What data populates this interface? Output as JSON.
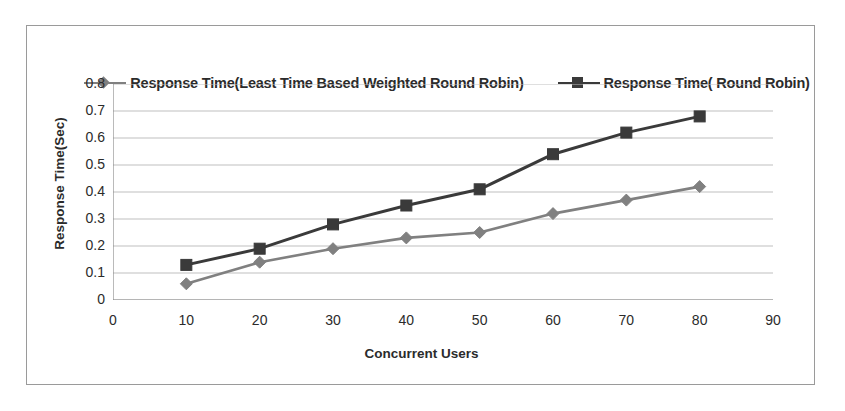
{
  "chart_data": {
    "type": "line",
    "title": "",
    "xlabel": "Concurrent Users",
    "ylabel": "Response Time(Sec)",
    "x": [
      10,
      20,
      30,
      40,
      50,
      60,
      70,
      80
    ],
    "xlim": [
      0,
      90
    ],
    "ylim": [
      0,
      0.8
    ],
    "xticks": [
      "0",
      "10",
      "20",
      "30",
      "40",
      "50",
      "60",
      "70",
      "80",
      "90"
    ],
    "xtick_values": [
      0,
      10,
      20,
      30,
      40,
      50,
      60,
      70,
      80,
      90
    ],
    "yticks": [
      "0",
      "0.1",
      "0.2",
      "0.3",
      "0.4",
      "0.5",
      "0.6",
      "0.7",
      "0.8"
    ],
    "ytick_values": [
      0,
      0.1,
      0.2,
      0.3,
      0.4,
      0.5,
      0.6,
      0.7,
      0.8
    ],
    "grid": "horizontal",
    "legend_position": "top",
    "series": [
      {
        "name": "Response Time(Least Time Based Weighted Round Robin)",
        "marker": "diamond",
        "color": "#808080",
        "values": [
          0.06,
          0.14,
          0.19,
          0.23,
          0.25,
          0.32,
          0.37,
          0.42
        ]
      },
      {
        "name": "Response Time( Round Robin)",
        "marker": "square",
        "color": "#3a3a3a",
        "values": [
          0.13,
          0.19,
          0.28,
          0.35,
          0.41,
          0.54,
          0.62,
          0.68
        ]
      }
    ]
  },
  "colors": {
    "series_1": "#808080",
    "series_2": "#3a3a3a",
    "grid": "#bfbfbf",
    "axis": "#8c8c8c",
    "frame": "#9a9a9a",
    "text": "#2b2b2b",
    "background": "#ffffff"
  }
}
